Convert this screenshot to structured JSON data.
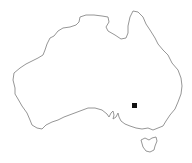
{
  "map": {
    "region": "Australia",
    "background_color": "#ffffff",
    "outline_color": "#8a8a8a",
    "landmasses": [
      {
        "name": "Australia mainland"
      },
      {
        "name": "Tasmania"
      }
    ],
    "markers": [
      {
        "id": "marker-1",
        "shape": "square",
        "color": "#111111",
        "x": 134.5,
        "y": 105.5
      }
    ]
  }
}
